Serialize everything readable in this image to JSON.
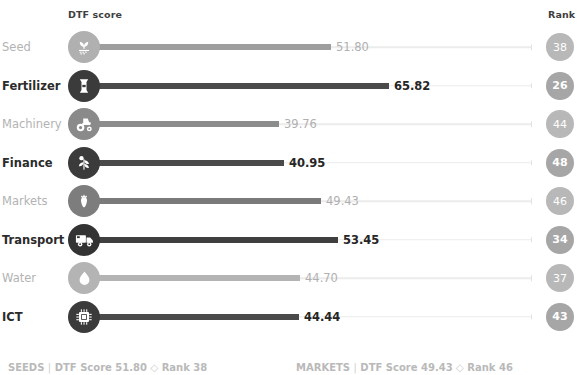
{
  "header": {
    "dtf_label": "DTF score",
    "rank_label": "Rank"
  },
  "chart_data": {
    "type": "bar",
    "title": "DTF score",
    "xlabel": "",
    "ylabel": "",
    "orientation": "horizontal",
    "xlim": [
      0,
      100
    ],
    "grid": false,
    "legend": "none",
    "categories": [
      "Seed",
      "Fertilizer",
      "Machinery",
      "Finance",
      "Markets",
      "Transport",
      "Water",
      "ICT"
    ],
    "values": [
      51.8,
      65.82,
      39.76,
      40.95,
      49.43,
      53.45,
      44.7,
      44.44
    ],
    "value_labels": [
      "51.80",
      "65.82",
      "39.76",
      "40.95",
      "49.43",
      "53.45",
      "44.70",
      "44.44"
    ],
    "ranks": [
      38,
      26,
      44,
      48,
      46,
      34,
      37,
      43
    ],
    "rank_labels": [
      "38",
      "26",
      "44",
      "48",
      "46",
      "34",
      "37",
      "43"
    ],
    "icons": [
      "seedling-icon",
      "fertilizer-bag-icon",
      "tractor-icon",
      "finance-plant-icon",
      "carrot-icon",
      "truck-icon",
      "water-drop-icon",
      "chip-icon"
    ],
    "emphasis": [
      "dim",
      "strong",
      "dim",
      "strong",
      "dim",
      "strong",
      "dim",
      "strong"
    ]
  },
  "rows": [
    {
      "label": "Seed",
      "value": "51.80",
      "rank": "38",
      "icon": "seedling-icon",
      "state": "dim",
      "bar_color": "#9e9e9e",
      "icon_bg": "#b0b0b0",
      "bar_end_px": 331,
      "value_x_px": 336
    },
    {
      "label": "Fertilizer",
      "value": "65.82",
      "rank": "26",
      "icon": "fertilizer-bag-icon",
      "state": "strong",
      "bar_color": "#4a4a4a",
      "icon_bg": "#3b3b3b",
      "bar_end_px": 389,
      "value_x_px": 394
    },
    {
      "label": "Machinery",
      "value": "39.76",
      "rank": "44",
      "icon": "tractor-icon",
      "state": "dim",
      "bar_color": "#8c8c8c",
      "icon_bg": "#8a8a8a",
      "bar_end_px": 279,
      "value_x_px": 284
    },
    {
      "label": "Finance",
      "value": "40.95",
      "rank": "48",
      "icon": "finance-plant-icon",
      "state": "strong",
      "bar_color": "#4a4a4a",
      "icon_bg": "#3b3b3b",
      "bar_end_px": 284,
      "value_x_px": 289
    },
    {
      "label": "Markets",
      "value": "49.43",
      "rank": "46",
      "icon": "carrot-icon",
      "state": "dim",
      "bar_color": "#7a7a7a",
      "icon_bg": "#7d7d7d",
      "bar_end_px": 321,
      "value_x_px": 326
    },
    {
      "label": "Transport",
      "value": "53.45",
      "rank": "34",
      "icon": "truck-icon",
      "state": "strong",
      "bar_color": "#3f3f3f",
      "icon_bg": "#333333",
      "bar_end_px": 338,
      "value_x_px": 343
    },
    {
      "label": "Water",
      "value": "44.70",
      "rank": "37",
      "icon": "water-drop-icon",
      "state": "dim",
      "bar_color": "#b4b4b4",
      "icon_bg": "#b4b4b4",
      "bar_end_px": 300,
      "value_x_px": 305
    },
    {
      "label": "ICT",
      "value": "44.44",
      "rank": "43",
      "icon": "chip-icon",
      "state": "strong",
      "bar_color": "#4a4a4a",
      "icon_bg": "#3b3b3b",
      "bar_end_px": 299,
      "value_x_px": 304
    }
  ],
  "footer": {
    "left": {
      "name": "SEEDS",
      "sep": "|",
      "score_label": "DTF Score 51.80",
      "diamond": "◇",
      "rank_label": "Rank 38"
    },
    "right": {
      "name": "MARKETS",
      "sep": "|",
      "score_label": "DTF Score 49.43",
      "diamond": "◇",
      "rank_label": "Rank 46"
    }
  }
}
